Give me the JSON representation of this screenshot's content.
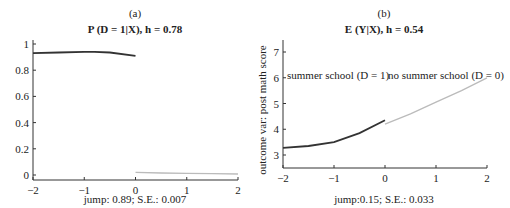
{
  "chart_data": [
    {
      "type": "line",
      "panel_label": "(a)",
      "title": "P (D = 1|X), h = 0.78",
      "xlabel": "",
      "ylabel": "",
      "xlim": [
        -2,
        2
      ],
      "ylim": [
        -0.05,
        1.05
      ],
      "xticks": [
        "-2",
        "-1",
        "0",
        "1",
        "2"
      ],
      "yticks": [
        "0",
        "0.2",
        "0.4",
        "0.6",
        "0.8",
        "1"
      ],
      "grid": false,
      "series": [
        {
          "name": "left of cutoff (D = 1)",
          "color": "#333333",
          "x": [
            -2,
            -1.5,
            -1,
            -0.8,
            -0.5,
            0
          ],
          "y": [
            0.93,
            0.935,
            0.94,
            0.94,
            0.935,
            0.91
          ]
        },
        {
          "name": "right of cutoff (D = 0)",
          "color": "#bbbbbb",
          "x": [
            0,
            0.5,
            1,
            1.5,
            2
          ],
          "y": [
            0.02,
            0.015,
            0.012,
            0.01,
            0.008
          ]
        }
      ],
      "footnote": "jump: 0.89;   S.E.: 0.007"
    },
    {
      "type": "line",
      "panel_label": "(b)",
      "title": "E (Y|X), h = 0.54",
      "xlabel": "",
      "ylabel": "outcome var: post math score",
      "xlim": [
        -2,
        2
      ],
      "ylim": [
        2.5,
        7.5
      ],
      "xticks": [
        "-2",
        "-1",
        "0",
        "1",
        "2"
      ],
      "yticks": [
        "3",
        "4",
        "5",
        "6",
        "7"
      ],
      "grid": false,
      "annotations": [
        "summer school (D = 1)",
        "no summer school (D = 0)"
      ],
      "series": [
        {
          "name": "summer school (D = 1)",
          "color": "#333333",
          "x": [
            -2,
            -1.5,
            -1,
            -0.5,
            0
          ],
          "y": [
            3.28,
            3.35,
            3.5,
            3.85,
            4.35
          ]
        },
        {
          "name": "no summer school (D = 0)",
          "color": "#bbbbbb",
          "x": [
            0,
            0.5,
            1,
            1.5,
            2
          ],
          "y": [
            4.2,
            4.6,
            5.05,
            5.5,
            6.0
          ]
        }
      ],
      "footnote": "jump:0.15;   S.E.: 0.033"
    }
  ]
}
